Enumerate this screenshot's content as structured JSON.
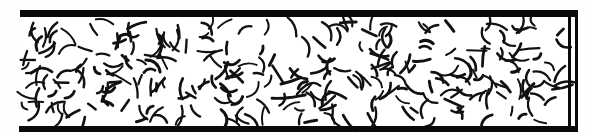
{
  "figure": {
    "type": "scanned-schematic",
    "width": 590,
    "height": 136,
    "background_color": "#fefefe",
    "ink_color": "#0a0a0a"
  },
  "channel": {
    "name": "rectangular-channel",
    "open_end": "left",
    "closed_end": "right",
    "interior_fill": "#ffffff",
    "top_wall": {
      "label": "top wall",
      "x1": 20,
      "y1": 13.5,
      "x2": 578,
      "y2": 13.5,
      "thickness": 7,
      "color": "#0a0a0a"
    },
    "bottom_wall": {
      "label": "bottom wall",
      "x1": 19,
      "y1": 129,
      "x2": 578,
      "y2": 129,
      "thickness": 6,
      "color": "#0a0a0a"
    },
    "end_wall_inner": {
      "label": "inner end wall",
      "x1": 569.5,
      "y1": 14,
      "x2": 569.5,
      "y2": 129,
      "thickness": 3,
      "color": "#0a0a0a"
    },
    "end_wall_outer": {
      "label": "outer end wall",
      "x1": 576.5,
      "y1": 11,
      "x2": 576.5,
      "y2": 132,
      "thickness": 3,
      "color": "#0a0a0a"
    },
    "interior": {
      "x": 20,
      "y": 17,
      "width": 548,
      "height": 109
    }
  },
  "chart_data": {
    "type": "scatter",
    "xlabel": "",
    "ylabel": "",
    "xlim": [
      20,
      568
    ],
    "ylim": [
      17,
      126
    ],
    "grid": false,
    "legend": null,
    "series": [
      {
        "name": "fibers",
        "description": "Short, slightly curved rod-like segments at uniformly random orientations, uniformly distributed across the channel interior",
        "count": 300,
        "stroke_color": "#111111",
        "stroke_width_range": [
          1.9,
          3.0
        ],
        "length_range": [
          8,
          21
        ],
        "curvature_range": [
          -0.45,
          0.45
        ],
        "orientation_distribution": "uniform 0-360 degrees",
        "spatial_distribution": "uniform random over channel interior"
      }
    ]
  },
  "render": {
    "fiber_count": 300,
    "seed": 20240517
  }
}
